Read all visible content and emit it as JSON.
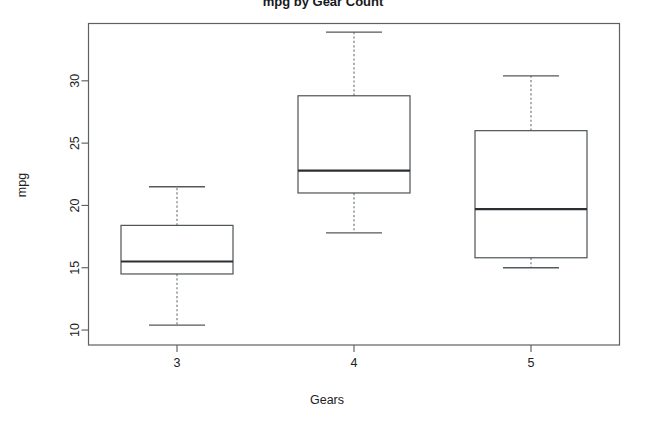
{
  "chart_data": {
    "type": "box",
    "title": "mpg by Gear Count",
    "xlabel": "Gears",
    "ylabel": "mpg",
    "categories": [
      "3",
      "4",
      "5"
    ],
    "ylim": [
      8.8,
      34.6
    ],
    "yticks": [
      10,
      15,
      20,
      25,
      30
    ],
    "ytick_labels": [
      "10",
      "15",
      "20",
      "25",
      "30"
    ],
    "grid": false,
    "legend": "none",
    "boxes": [
      {
        "category": "3",
        "whisker_low": 10.4,
        "q1": 14.5,
        "median": 15.5,
        "q3": 18.4,
        "whisker_high": 21.5,
        "outliers": []
      },
      {
        "category": "4",
        "whisker_low": 17.8,
        "q1": 21.0,
        "median": 22.8,
        "q3": 28.8,
        "whisker_high": 33.9,
        "outliers": []
      },
      {
        "category": "5",
        "whisker_low": 15.0,
        "q1": 15.8,
        "median": 19.7,
        "q3": 26.0,
        "whisker_high": 30.4,
        "outliers": []
      }
    ]
  },
  "colors": {
    "background": "#ffffff",
    "frame": "#5b6164",
    "box_outline": "#4d5356",
    "median": "#2b2f31",
    "whisker": "#6a7073",
    "text": "#1d2022"
  },
  "axes": {
    "y_axis_label": "mpg",
    "x_axis_label": "Gears",
    "y_tick_values": [
      "30",
      "25",
      "20",
      "15",
      "10"
    ],
    "x_tick_values": [
      "3",
      "4",
      "5"
    ]
  },
  "header": {
    "title": "mpg by Gear Count"
  }
}
